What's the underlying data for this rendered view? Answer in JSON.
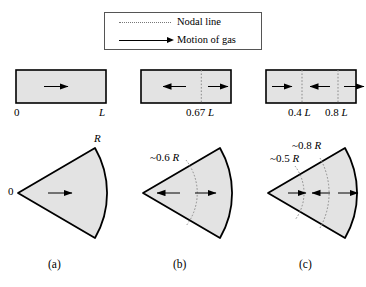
{
  "legend": {
    "items": [
      {
        "icon": "dotted-line-icon",
        "label": "Nodal line"
      },
      {
        "icon": "arrow-right-icon",
        "label": "Motion of gas"
      }
    ]
  },
  "panels": [
    {
      "id": "a",
      "caption": "(a)",
      "tube": {
        "left_label": "0",
        "right_label": "L",
        "nodal_lines": [],
        "nodal_labels": [],
        "arrows": [
          {
            "x_frac": 0.5,
            "dir": "right"
          }
        ]
      },
      "cone": {
        "apex_label": "0",
        "radius_label": "R",
        "nodal_arcs": [],
        "nodal_labels": [],
        "arrows": [
          {
            "x_frac": 0.5,
            "dir": "right"
          }
        ]
      }
    },
    {
      "id": "b",
      "caption": "(b)",
      "tube": {
        "left_label": "",
        "right_label": "",
        "nodal_lines": [
          0.67
        ],
        "nodal_labels": [
          {
            "value": "0.67",
            "unit": "L",
            "at": 0.67
          }
        ],
        "arrows": [
          {
            "x_frac": 0.33,
            "dir": "left"
          },
          {
            "x_frac": 0.84,
            "dir": "right"
          }
        ]
      },
      "cone": {
        "apex_label": "",
        "radius_label": "",
        "nodal_arcs": [
          0.6
        ],
        "nodal_labels": [
          {
            "value": "~0.6",
            "unit": "R"
          }
        ],
        "arrows": [
          {
            "x_frac": 0.34,
            "dir": "left"
          },
          {
            "x_frac": 0.8,
            "dir": "right"
          }
        ]
      }
    },
    {
      "id": "c",
      "caption": "(c)",
      "tube": {
        "left_label": "",
        "right_label": "",
        "nodal_lines": [
          0.4,
          0.8
        ],
        "nodal_labels": [
          {
            "value": "0.4",
            "unit": "L",
            "at": 0.4
          },
          {
            "value": "0.8",
            "unit": "L",
            "at": 0.8
          }
        ],
        "arrows": [
          {
            "x_frac": 0.2,
            "dir": "right"
          },
          {
            "x_frac": 0.58,
            "dir": "left"
          },
          {
            "x_frac": 0.93,
            "dir": "right"
          }
        ]
      },
      "cone": {
        "apex_label": "",
        "radius_label": "",
        "nodal_arcs": [
          0.5,
          0.8
        ],
        "nodal_labels": [
          {
            "value": "~0.8",
            "unit": "R"
          },
          {
            "value": "~0.5",
            "unit": "R"
          }
        ],
        "arrows": [
          {
            "x_frac": 0.26,
            "dir": "right"
          },
          {
            "x_frac": 0.62,
            "dir": "left"
          },
          {
            "x_frac": 0.95,
            "dir": "right"
          }
        ]
      }
    }
  ],
  "colors": {
    "fill": "#e3e3e3",
    "stroke": "#000000",
    "nodal": "#8a8a8a",
    "legend_border": "#555555"
  }
}
